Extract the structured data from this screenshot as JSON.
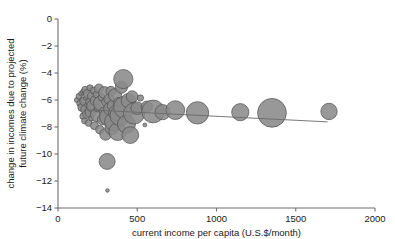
{
  "chart_data": {
    "type": "scatter",
    "title": "",
    "xlabel": "current income per capita (U.S.$/month)",
    "ylabel_line1": "change in incomes due to projected",
    "ylabel_line2": "future climate change (%)",
    "xlim": [
      0,
      2000
    ],
    "ylim": [
      -14,
      0
    ],
    "xticks": [
      0,
      500,
      1000,
      1500,
      2000
    ],
    "xticklabels": [
      "0",
      "500",
      "1000",
      "1500",
      "2000"
    ],
    "yticks": [
      0,
      -2,
      -4,
      -6,
      -8,
      -10,
      -12,
      -14
    ],
    "yticklabels": [
      "0",
      "−2",
      "−4",
      "−6",
      "−8",
      "−10",
      "−12",
      "−14"
    ],
    "grid": false,
    "legend": null,
    "marker_shape": "circle",
    "marker_fill": "#8a8a8a",
    "marker_stroke": "#4f4f4f",
    "trend_color": "#6a6a6a",
    "size_encoding": "bubble area proportional to population",
    "trend_line": {
      "x0": 180,
      "y0": -6.72,
      "x1": 1700,
      "y1": -7.62
    },
    "points": [
      {
        "x": 120,
        "y": -6.0,
        "r": 2.6
      },
      {
        "x": 133,
        "y": -5.72,
        "r": 3.0
      },
      {
        "x": 140,
        "y": -6.25,
        "r": 3.4
      },
      {
        "x": 146,
        "y": -5.52,
        "r": 2.4
      },
      {
        "x": 150,
        "y": -6.55,
        "r": 4.0
      },
      {
        "x": 152,
        "y": -5.95,
        "r": 2.2
      },
      {
        "x": 158,
        "y": -7.2,
        "r": 3.2
      },
      {
        "x": 160,
        "y": -5.4,
        "r": 2.8
      },
      {
        "x": 165,
        "y": -6.1,
        "r": 4.4
      },
      {
        "x": 168,
        "y": -7.55,
        "r": 3.0
      },
      {
        "x": 172,
        "y": -5.25,
        "r": 3.6
      },
      {
        "x": 175,
        "y": -6.7,
        "r": 5.0
      },
      {
        "x": 178,
        "y": -5.85,
        "r": 2.6
      },
      {
        "x": 182,
        "y": -7.05,
        "r": 4.2
      },
      {
        "x": 186,
        "y": -6.35,
        "r": 2.9
      },
      {
        "x": 190,
        "y": -5.55,
        "r": 4.8
      },
      {
        "x": 194,
        "y": -7.7,
        "r": 3.4
      },
      {
        "x": 198,
        "y": -6.15,
        "r": 3.8
      },
      {
        "x": 202,
        "y": -5.1,
        "r": 3.1
      },
      {
        "x": 206,
        "y": -6.9,
        "r": 5.6
      },
      {
        "x": 210,
        "y": -7.35,
        "r": 2.7
      },
      {
        "x": 215,
        "y": -5.7,
        "r": 4.6
      },
      {
        "x": 220,
        "y": -6.45,
        "r": 6.2
      },
      {
        "x": 226,
        "y": -5.3,
        "r": 3.5
      },
      {
        "x": 230,
        "y": -7.9,
        "r": 4.0
      },
      {
        "x": 236,
        "y": -6.05,
        "r": 5.2
      },
      {
        "x": 242,
        "y": -5.6,
        "r": 3.3
      },
      {
        "x": 248,
        "y": -7.1,
        "r": 6.8
      },
      {
        "x": 252,
        "y": -6.6,
        "r": 3.9
      },
      {
        "x": 258,
        "y": -5.15,
        "r": 4.5
      },
      {
        "x": 264,
        "y": -8.2,
        "r": 4.1
      },
      {
        "x": 270,
        "y": -6.25,
        "r": 7.4
      },
      {
        "x": 276,
        "y": -5.8,
        "r": 3.7
      },
      {
        "x": 282,
        "y": -7.45,
        "r": 5.4
      },
      {
        "x": 288,
        "y": -6.85,
        "r": 4.3
      },
      {
        "x": 294,
        "y": -5.45,
        "r": 6.0
      },
      {
        "x": 300,
        "y": -8.55,
        "r": 5.8
      },
      {
        "x": 305,
        "y": -6.15,
        "r": 4.7
      },
      {
        "x": 310,
        "y": -10.55,
        "r": 8.0
      },
      {
        "x": 312,
        "y": -12.7,
        "r": 1.8
      },
      {
        "x": 316,
        "y": -7.25,
        "r": 8.6
      },
      {
        "x": 322,
        "y": -5.95,
        "r": 5.1
      },
      {
        "x": 328,
        "y": -6.65,
        "r": 6.4
      },
      {
        "x": 334,
        "y": -5.35,
        "r": 4.9
      },
      {
        "x": 340,
        "y": -8.05,
        "r": 7.0
      },
      {
        "x": 346,
        "y": -6.4,
        "r": 5.5
      },
      {
        "x": 352,
        "y": -7.6,
        "r": 9.2
      },
      {
        "x": 360,
        "y": -5.65,
        "r": 6.6
      },
      {
        "x": 368,
        "y": -6.95,
        "r": 7.8
      },
      {
        "x": 376,
        "y": -8.35,
        "r": 8.8
      },
      {
        "x": 384,
        "y": -6.2,
        "r": 5.3
      },
      {
        "x": 392,
        "y": -7.15,
        "r": 10.2
      },
      {
        "x": 400,
        "y": -5.05,
        "r": 6.1
      },
      {
        "x": 412,
        "y": -4.45,
        "r": 9.6
      },
      {
        "x": 420,
        "y": -6.55,
        "r": 11.0
      },
      {
        "x": 432,
        "y": -7.8,
        "r": 9.0
      },
      {
        "x": 444,
        "y": -6.05,
        "r": 7.2
      },
      {
        "x": 456,
        "y": -8.6,
        "r": 8.4
      },
      {
        "x": 468,
        "y": -5.75,
        "r": 5.9
      },
      {
        "x": 480,
        "y": -7.0,
        "r": 10.6
      },
      {
        "x": 500,
        "y": -6.6,
        "r": 6.3
      },
      {
        "x": 520,
        "y": -5.85,
        "r": 3.1
      },
      {
        "x": 548,
        "y": -7.85,
        "r": 1.9
      },
      {
        "x": 560,
        "y": -6.5,
        "r": 5.7
      },
      {
        "x": 600,
        "y": -6.85,
        "r": 11.4
      },
      {
        "x": 660,
        "y": -6.9,
        "r": 7.6
      },
      {
        "x": 740,
        "y": -6.75,
        "r": 9.4
      },
      {
        "x": 880,
        "y": -6.95,
        "r": 11.2
      },
      {
        "x": 1150,
        "y": -6.9,
        "r": 8.6
      },
      {
        "x": 1350,
        "y": -6.95,
        "r": 14.4
      },
      {
        "x": 1710,
        "y": -6.85,
        "r": 8.2
      }
    ]
  },
  "geometry": {
    "plot_left": 58,
    "plot_right": 375,
    "plot_top": 19,
    "plot_bottom": 208
  }
}
